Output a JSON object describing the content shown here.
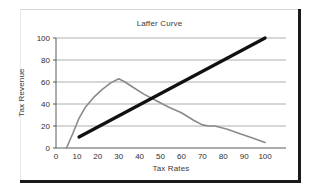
{
  "chart_data": {
    "type": "line",
    "title": "Laffer Curve",
    "xlabel": "Tax Rates",
    "ylabel": "Tax Revenue",
    "xlim": [
      0,
      110
    ],
    "ylim": [
      0,
      100
    ],
    "grid": true,
    "legend": "none",
    "xticks": [
      0,
      10,
      20,
      30,
      40,
      50,
      60,
      70,
      80,
      90,
      100
    ],
    "yticks": [
      0,
      20,
      40,
      60,
      80,
      100
    ],
    "gridlines_y": [
      20,
      40,
      60,
      80,
      100
    ],
    "series": [
      {
        "name": "Laffer curve",
        "color": "#8a8a8a",
        "width": 1.6,
        "x": [
          5,
          8,
          11,
          14,
          18,
          22,
          26,
          30,
          33,
          37,
          42,
          48,
          54,
          60,
          66,
          70,
          73,
          76,
          82,
          88,
          94,
          100
        ],
        "values": [
          0,
          13,
          27,
          37,
          46,
          53,
          59,
          63,
          60,
          55,
          49,
          43,
          37,
          32,
          25,
          21,
          20,
          20,
          17,
          13,
          9,
          5
        ]
      },
      {
        "name": "Tax rate line",
        "color": "#111111",
        "width": 3.2,
        "x": [
          11,
          100
        ],
        "values": [
          10,
          100
        ]
      }
    ],
    "annotations": []
  },
  "figure": {
    "title": "Laffer Curve",
    "xaxis_title": "Tax Rates",
    "yaxis_title": "Tax Revenue"
  }
}
